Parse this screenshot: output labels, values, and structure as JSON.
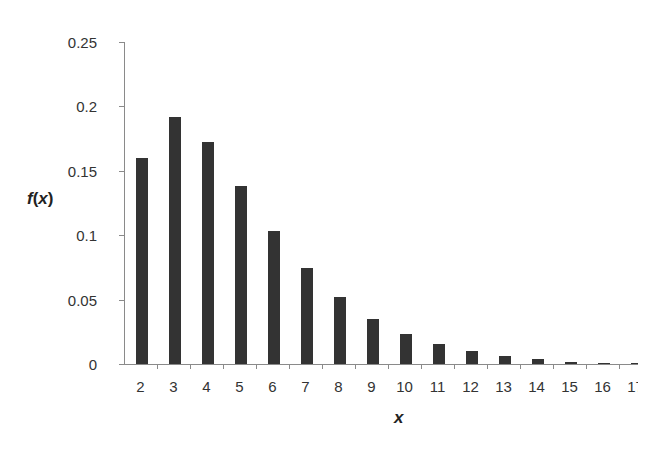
{
  "chart_data": {
    "type": "bar",
    "title": "",
    "xlabel": "x",
    "ylabel": "f(x)",
    "ylabel_parts": {
      "fn": "f",
      "open": "(",
      "var": "x",
      "close": ")"
    },
    "ylim": [
      0,
      0.25
    ],
    "yticks": [
      "0",
      "0.05",
      "0.1",
      "0.15",
      "0.2",
      "0.25"
    ],
    "ytick_values": [
      0,
      0.05,
      0.1,
      0.15,
      0.2,
      0.25
    ],
    "categories": [
      "2",
      "3",
      "4",
      "5",
      "6",
      "7",
      "8",
      "9",
      "10",
      "11",
      "12",
      "13",
      "14",
      "15",
      "16",
      "17"
    ],
    "values": [
      0.16,
      0.192,
      0.172,
      0.138,
      0.103,
      0.0745,
      0.052,
      0.035,
      0.023,
      0.0155,
      0.0099,
      0.0062,
      0.0038,
      0.0016,
      0.0006,
      0.0003
    ],
    "grid": false,
    "legend": null,
    "bar_color": "#333333",
    "axis_color": "#8a8a8a"
  }
}
